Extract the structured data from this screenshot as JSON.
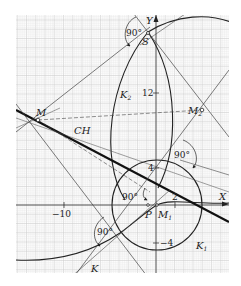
{
  "figure": {
    "type": "geometric construction on graph paper",
    "colors": {
      "grid_minor": "#e2e2e2",
      "grid_major": "#cfcfcf",
      "ink": "#222222",
      "background": "#ffffff"
    },
    "axes": {
      "x_label": "X",
      "y_label": "Y",
      "tick_labels": {
        "x_neg10": "−10",
        "x_2": "2",
        "y_12": "12",
        "y_4": "4",
        "y_neg4": "−4"
      }
    },
    "points": {
      "M": "M",
      "M2": "M",
      "M2_sub": "2",
      "M1": "M",
      "M1_sub": "1",
      "S": "S",
      "P": "P"
    },
    "curves": {
      "K": "K",
      "K1": "K",
      "K1_sub": "1",
      "K2": "K",
      "K2_sub": "2",
      "CH": "CH"
    },
    "angle_labels": {
      "top": "90°",
      "right": "90°",
      "center": "90°",
      "bottom_left": "90°"
    }
  }
}
